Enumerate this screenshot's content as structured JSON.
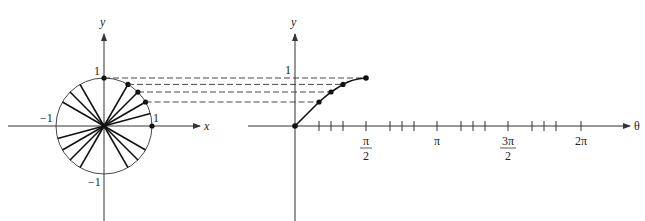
{
  "left_plot": {
    "y_label": "y",
    "x_label": "x",
    "tick_labels": {
      "pos_y": "1",
      "neg_y": "−1",
      "pos_x": "1",
      "neg_x": "−1"
    },
    "radius_angles_deg": [
      0,
      15,
      30,
      45,
      60,
      90,
      120,
      135,
      150,
      195,
      210,
      225,
      240,
      300,
      315,
      330
    ],
    "marked_points_deg": [
      0,
      30,
      45,
      60,
      90
    ]
  },
  "right_plot": {
    "y_label": "y",
    "x_label": "θ",
    "y_tick": "1",
    "x_ticks": [
      {
        "label_num": "π",
        "label_den": "2",
        "frac": true
      },
      {
        "label": "π",
        "frac": false
      },
      {
        "label_num": "3π",
        "label_den": "2",
        "frac": true
      },
      {
        "label": "2π",
        "frac": false
      }
    ],
    "curve_points": [
      {
        "theta": "0",
        "y": 0
      },
      {
        "theta": "π/6",
        "y": 0.5
      },
      {
        "theta": "π/4",
        "y": 0.707
      },
      {
        "theta": "π/3",
        "y": 0.866
      },
      {
        "theta": "π/2",
        "y": 1
      }
    ]
  }
}
